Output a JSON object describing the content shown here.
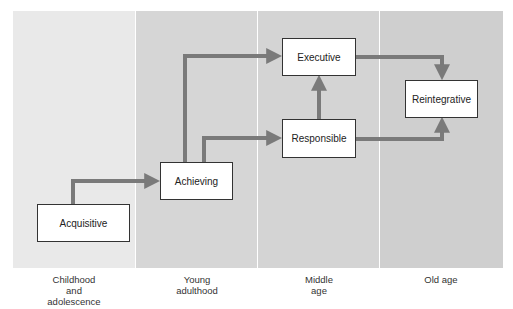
{
  "diagram": {
    "type": "stage-flow",
    "columns": [
      {
        "id": "childhood",
        "label_lines": [
          "Childhood",
          "and",
          "adolescence"
        ]
      },
      {
        "id": "young",
        "label_lines": [
          "Young",
          "adulthood"
        ]
      },
      {
        "id": "middle",
        "label_lines": [
          "Middle",
          "age"
        ]
      },
      {
        "id": "old",
        "label_lines": [
          "Old age"
        ]
      }
    ],
    "nodes": {
      "acquisitive": "Acquisitive",
      "achieving": "Achieving",
      "executive": "Executive",
      "responsible": "Responsible",
      "reintegrative": "Reintegrative"
    },
    "edges": [
      {
        "from": "Acquisitive",
        "to": "Achieving"
      },
      {
        "from": "Achieving",
        "to": "Executive"
      },
      {
        "from": "Achieving",
        "to": "Responsible"
      },
      {
        "from": "Responsible",
        "to": "Executive"
      },
      {
        "from": "Executive",
        "to": "Reintegrative"
      },
      {
        "from": "Responsible",
        "to": "Reintegrative"
      }
    ],
    "colors": {
      "arrow": "#7a7a7a",
      "col_childhood": "#e9e9e9",
      "col_young": "#d6d6d6",
      "col_middle": "#d4d4d4",
      "col_old": "#cfcfcf"
    }
  }
}
